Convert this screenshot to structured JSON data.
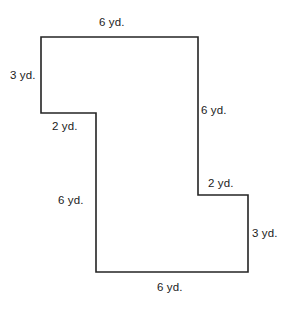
{
  "figure": {
    "shape_name": "irregular-polygon",
    "unit": "yd.",
    "stroke_color": "#242424",
    "fill_color": "#ffffff",
    "background_color": "#ffffff",
    "stroke_width": 1.6,
    "vertices": [
      [
        41,
        37
      ],
      [
        198,
        37
      ],
      [
        198,
        195
      ],
      [
        248,
        195
      ],
      [
        248,
        272
      ],
      [
        96,
        272
      ],
      [
        96,
        113
      ],
      [
        41,
        113
      ]
    ],
    "labels": {
      "top_6": "6 yd.",
      "left_3": "3 yd.",
      "left_2": "2 yd.",
      "right_6": "6 yd.",
      "inner_6": "6 yd.",
      "right_2": "2 yd.",
      "right_3": "3 yd.",
      "bottom_6": "6 yd."
    },
    "sides": [
      {
        "name": "top-edge",
        "label": "6 yd.",
        "length": 6,
        "unit": "yd.",
        "orientation": "horizontal"
      },
      {
        "name": "upper-left-edge",
        "label": "3 yd.",
        "length": 3,
        "unit": "yd.",
        "orientation": "vertical"
      },
      {
        "name": "upper-notch-edge",
        "label": "2 yd.",
        "length": 2,
        "unit": "yd.",
        "orientation": "horizontal"
      },
      {
        "name": "right-upper-edge",
        "label": "6 yd.",
        "length": 6,
        "unit": "yd.",
        "orientation": "vertical"
      },
      {
        "name": "middle-left-edge",
        "label": "6 yd.",
        "length": 6,
        "unit": "yd.",
        "orientation": "vertical"
      },
      {
        "name": "lower-notch-edge",
        "label": "2 yd.",
        "length": 2,
        "unit": "yd.",
        "orientation": "horizontal"
      },
      {
        "name": "right-lower-edge",
        "label": "3 yd.",
        "length": 3,
        "unit": "yd.",
        "orientation": "vertical"
      },
      {
        "name": "bottom-edge",
        "label": "6 yd.",
        "length": 6,
        "unit": "yd.",
        "orientation": "horizontal"
      }
    ]
  }
}
